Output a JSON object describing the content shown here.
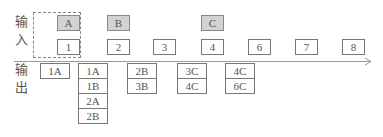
{
  "labels": {
    "input": [
      "输",
      "入"
    ],
    "output": [
      "输",
      "出"
    ]
  },
  "input_top_row": [
    {
      "label": "A",
      "col": 0
    },
    {
      "label": "B",
      "col": 1
    },
    {
      "label": "C",
      "col": 3
    }
  ],
  "input_bottom_row": [
    "1",
    "2",
    "3",
    "4",
    "6",
    "7",
    "8"
  ],
  "output_columns": [
    [
      "1A"
    ],
    [
      "1A",
      "1B",
      "2A",
      "2B"
    ],
    [
      "2B",
      "3B"
    ],
    [
      "3C",
      "4C"
    ],
    [
      "4C",
      "6C"
    ]
  ],
  "colors": {
    "shaded_fill": "#d2d2d2",
    "border": "#777777",
    "axis": "#999999"
  }
}
